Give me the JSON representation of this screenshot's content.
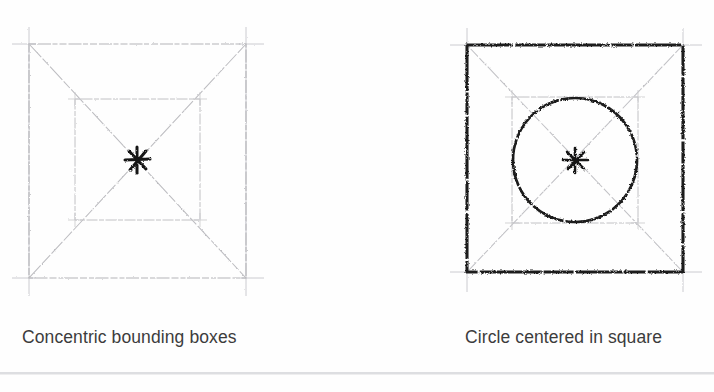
{
  "page": {
    "background_color": "#fefefe",
    "caption_color": "#3c3c3c",
    "rule_color": "#d8d9dc"
  },
  "figures": [
    {
      "id": "concentric-bounding-boxes",
      "caption": "Concentric bounding boxes",
      "ink": {
        "construction_color": "#b9b9bd",
        "light_square_color": "#c3c3c7",
        "heavy_color": "#1d1d1d"
      },
      "shapes": {
        "outer_square": {
          "x": 29,
          "y": 44,
          "width": 217,
          "height": 234,
          "stroke": "#b6b6ba",
          "weight": "light"
        },
        "inner_square": {
          "x": 75,
          "y": 99,
          "width": 125,
          "height": 121,
          "stroke": "#c0c0c4",
          "weight": "light"
        },
        "diagonals": "corner-to-corner both ways",
        "center_mark": {
          "x": 137,
          "y": 160,
          "type": "cross",
          "stroke": "#151515",
          "weight": "heavy"
        },
        "extension_ticks": true
      }
    },
    {
      "id": "circle-centered-in-square",
      "caption": "Circle centered in square",
      "ink": {
        "construction_color": "#b9b9bd",
        "light_square_color": "#c3c3c7",
        "heavy_color": "#1d1d1d"
      },
      "shapes": {
        "outer_square": {
          "x": 467,
          "y": 45,
          "width": 216,
          "height": 227,
          "stroke": "#1d1d1d",
          "weight": "heavy"
        },
        "inner_square": {
          "x": 512,
          "y": 97,
          "width": 126,
          "height": 126,
          "stroke": "#c0c0c4",
          "weight": "light"
        },
        "circle": {
          "cx": 575,
          "cy": 160,
          "r": 62,
          "stroke": "#1d1d1d",
          "weight": "heavy"
        },
        "diagonals": "corner-to-corner both ways",
        "center_mark": {
          "x": 575,
          "y": 160,
          "type": "cross",
          "stroke": "#151515",
          "weight": "heavy"
        },
        "extension_ticks": true
      }
    }
  ]
}
